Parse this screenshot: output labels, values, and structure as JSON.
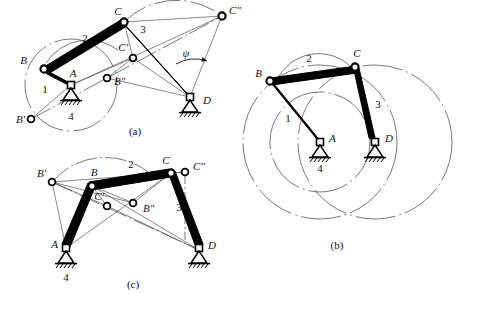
{
  "figure": {
    "subfigures": [
      {
        "id": "a",
        "caption": "(a)",
        "joint_labels": [
          "B",
          "C",
          "A",
          "D",
          "B'",
          "B\"",
          "C'",
          "C\""
        ],
        "link_labels": [
          "1",
          "2",
          "3",
          "4"
        ],
        "angle_label": "ψ"
      },
      {
        "id": "b",
        "caption": "(b)",
        "joint_labels": [
          "B",
          "C",
          "A",
          "D"
        ],
        "link_labels": [
          "1",
          "2",
          "3",
          "4"
        ]
      },
      {
        "id": "c",
        "caption": "(c)",
        "joint_labels": [
          "B",
          "C",
          "A",
          "D",
          "B'",
          "B\"",
          "C'",
          "C\""
        ],
        "link_labels": [
          "1",
          "2",
          "3",
          "4"
        ]
      }
    ]
  },
  "labels": {
    "A": "A",
    "B": "B",
    "C": "C",
    "D": "D",
    "B_prime": "B'",
    "B_dprime": "B\"",
    "C_prime": "C'",
    "C_dprime": "C\"",
    "one": "1",
    "two": "2",
    "three": "3",
    "four": "4",
    "psi": "ψ",
    "cap_a": "(a)",
    "cap_b": "(b)",
    "cap_c": "(c)"
  },
  "colors": {
    "ink": "#111111",
    "link_fill": "#000000",
    "construction": "#555555",
    "background": "#ffffff"
  }
}
